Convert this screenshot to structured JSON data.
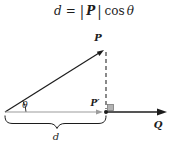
{
  "formula": {
    "lhs": "d",
    "equals": "=",
    "bar": "|",
    "vector": "P",
    "operator": "cos",
    "angle": "θ"
  },
  "diagram": {
    "labels": {
      "vector_p": "P",
      "projection_point": "P′",
      "vector_q": "Q",
      "angle": "θ",
      "distance": "d"
    },
    "colors": {
      "ink": "#1c1c1c",
      "gray_accent": "#9c9c9c",
      "right_angle_fill": "#b3b3b3",
      "background": "#ffffff"
    }
  }
}
